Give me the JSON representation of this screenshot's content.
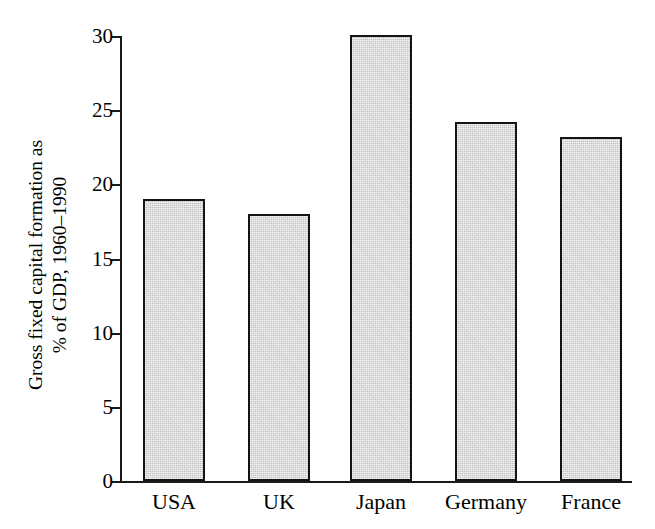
{
  "chart_data": {
    "type": "bar",
    "title": "",
    "subtitle": "",
    "xlabel": "",
    "ylabel_lines": [
      "Gross fixed capital formation as",
      "% of GDP, 1960–1990"
    ],
    "ylabel": "Gross fixed capital formation as % of GDP, 1960–1990",
    "categories": [
      "USA",
      "UK",
      "Japan",
      "Germany",
      "France"
    ],
    "values": [
      19.0,
      18.0,
      30.1,
      24.2,
      23.2
    ],
    "ylim": [
      0,
      30
    ],
    "yticks": [
      0,
      5,
      10,
      15,
      20,
      25,
      30
    ],
    "ytick_labels": [
      "0",
      "5",
      "10",
      "15",
      "20",
      "25",
      "30"
    ],
    "grid": false,
    "legend": null,
    "legend_position": "none",
    "series": [
      {
        "name": "Gross fixed capital formation as % of GDP, 1960-1990",
        "values": [
          19.0,
          18.0,
          30.1,
          24.2,
          23.2
        ]
      }
    ],
    "colors": {
      "bar_fill": "#c8c8c8",
      "bar_edge": "#141414",
      "axis": "#1a1a1a",
      "background": "#ffffff",
      "text": "#000000"
    }
  }
}
